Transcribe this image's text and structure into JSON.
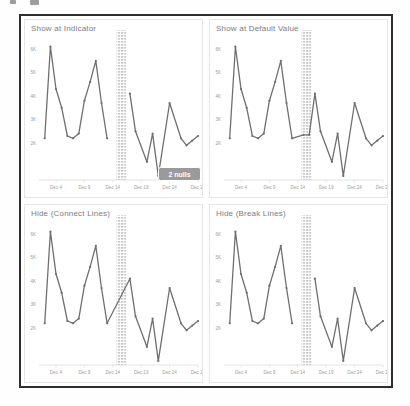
{
  "page": {
    "background": "#fefefe"
  },
  "figure": {
    "frame_border_color": "#2e2e2e"
  },
  "colors": {
    "line": "#6f6f6f",
    "marker": "#6f6f6f",
    "band_stripe": "#c9c9c9",
    "badge_bg": "#9a9a9a",
    "badge_text": "#ffffff",
    "title_text": "#7c7c7c",
    "tick_text": "#9d9d9d",
    "axis_line": "#dcdcdc",
    "panel_border": "#e6e6e6"
  },
  "chart_data": {
    "type": "line",
    "panels": [
      {
        "title": "Show at Indicator",
        "mode": "break",
        "badge": "2 nulls"
      },
      {
        "title": "Show at Default Value",
        "mode": "default"
      },
      {
        "title": "Hide (Connect Lines)",
        "mode": "connect"
      },
      {
        "title": "Hide (Break Lines)",
        "mode": "break"
      }
    ],
    "xlabel": "Date (December)",
    "days": [
      2,
      3,
      4,
      5,
      6,
      7,
      8,
      9,
      10,
      11,
      12,
      13,
      15,
      16,
      17,
      18,
      20,
      21,
      22,
      24,
      26,
      27,
      28,
      29
    ],
    "values": [
      2.2,
      6.1,
      4.3,
      3.5,
      2.3,
      2.2,
      2.4,
      3.8,
      4.6,
      5.5,
      3.7,
      2.2,
      null,
      null,
      4.1,
      2.5,
      1.2,
      2.4,
      0.6,
      3.7,
      2.2,
      1.9,
      2.1,
      2.3
    ],
    "null_days": [
      15,
      16
    ],
    "null_count": 2,
    "default_value": 2.35,
    "x_tick_days": [
      4,
      9,
      14,
      19,
      24,
      29
    ],
    "x_ticks": [
      "Dec 4",
      "Dec 9",
      "Dec 14",
      "Dec 19",
      "Dec 24",
      "Dec 29"
    ],
    "y_ticks": [
      "6K",
      "5K",
      "4K",
      "3K",
      "2K"
    ],
    "y_tick_values": [
      6,
      5,
      4,
      3,
      2
    ],
    "xlim_days": [
      1,
      29
    ],
    "ylim": [
      0.4,
      6.8
    ],
    "grid": false,
    "legend": "none"
  }
}
